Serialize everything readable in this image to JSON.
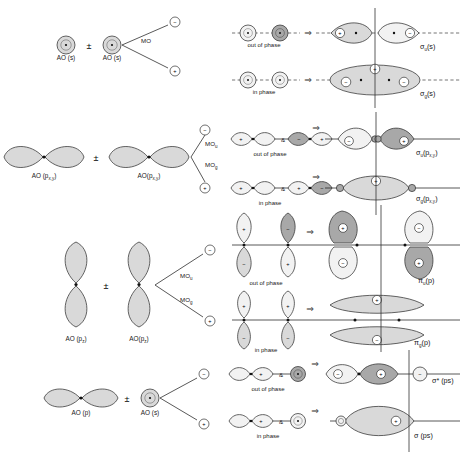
{
  "figure": {
    "symbols": {
      "plus_minus": "±",
      "implies": "⇒",
      "amp": "&",
      "minus_sign": "−",
      "plus_sign": "+"
    },
    "colors": {
      "lobe_light": "#d9d9d9",
      "lobe_dark": "#a8a8a8",
      "lobe_white": "#f2f2f2",
      "stroke": "#333333",
      "dash": "#3a3a3a",
      "text": "#202020"
    }
  },
  "rows": [
    {
      "id": "row-s-s",
      "left": {
        "ao_first": "AO (s)",
        "operator": "±",
        "ao_second": "AO (s)",
        "branch_label": "MO",
        "branch_upper_sign": "−",
        "branch_lower_sign": "+"
      },
      "combinations": [
        {
          "phase": "out of phase",
          "arrow": "⇒",
          "result_base": "σ",
          "result_sub": "u",
          "result_tail": "(s)"
        },
        {
          "phase": "in phase",
          "arrow": "⇒",
          "result_base": "σ",
          "result_sub": "g",
          "result_tail": "(s)"
        }
      ]
    },
    {
      "id": "row-pxy-pxy",
      "left": {
        "ao_first": "AO (p",
        "ao_first_sub": "x,y",
        "ao_first_tail": ")",
        "operator": "±",
        "ao_second": "AO(p",
        "ao_second_sub": "x,y",
        "ao_second_tail": ")",
        "branch_label_upper": "MO",
        "branch_label_upper_sub": "u",
        "branch_label_lower": "MO",
        "branch_label_lower_sub": "g",
        "branch_upper_sign": "−",
        "branch_lower_sign": "+"
      },
      "combinations": [
        {
          "phase": "out of phase",
          "arrow": "⇒",
          "result_base": "σ",
          "result_sub": "u",
          "result_tail": "(p",
          "result_tail_sub": "x,y",
          "result_tail_end": ")"
        },
        {
          "phase": "in phase",
          "arrow": "⇒",
          "result_base": "σ",
          "result_sub": "g",
          "result_tail": "(p",
          "result_tail_sub": "x,y",
          "result_tail_end": ")"
        }
      ]
    },
    {
      "id": "row-pz-pz",
      "left": {
        "ao_first": "AO (p",
        "ao_first_sub": "z",
        "ao_first_tail": ")",
        "operator": "±",
        "ao_second": "AO(p",
        "ao_second_sub": "z",
        "ao_second_tail": ")",
        "branch_label_upper": "MO",
        "branch_label_upper_sub": "u",
        "branch_label_lower": "MO",
        "branch_label_lower_sub": "g",
        "branch_upper_sign": "−",
        "branch_lower_sign": "+"
      },
      "combinations": [
        {
          "phase": "out of phase",
          "arrow": "⇒",
          "result_base": "π",
          "result_sub": "u",
          "result_tail": "(p)"
        },
        {
          "phase": "in phase",
          "arrow": "⇒",
          "result_base": "π",
          "result_sub": "g",
          "result_tail": "(p)"
        }
      ]
    },
    {
      "id": "row-p-s",
      "left": {
        "ao_first": "AO (p)",
        "operator": "±",
        "ao_second": "AO (s)",
        "branch_upper_sign": "−",
        "branch_lower_sign": "+"
      },
      "combinations": [
        {
          "phase": "out of phase",
          "arrow": "⇒",
          "result_base": "σ*",
          "result_sub": "",
          "result_tail": " (ps)"
        },
        {
          "phase": "in phase",
          "arrow": "⇒",
          "result_base": "σ",
          "result_sub": "",
          "result_tail": " (ps)"
        }
      ]
    }
  ]
}
